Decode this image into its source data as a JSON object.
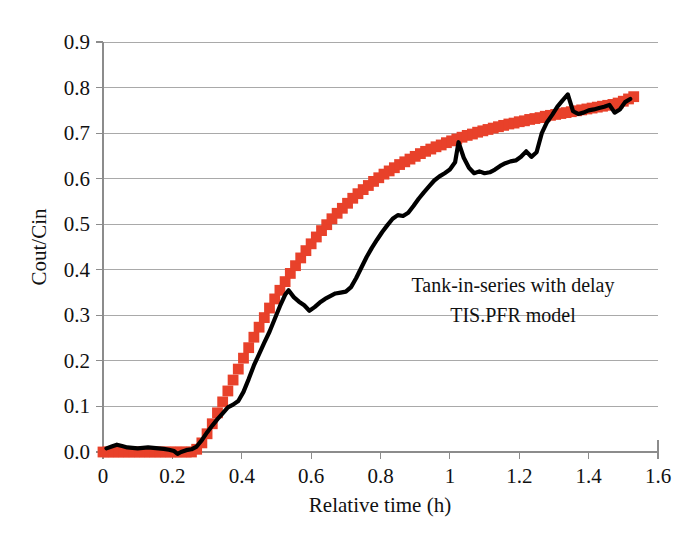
{
  "chart_data": {
    "type": "line",
    "title": "",
    "xlabel": "Relative time (h)",
    "ylabel": "Cout/Cin",
    "xlim": [
      0,
      1.6
    ],
    "ylim": [
      0.0,
      0.9
    ],
    "grid": true,
    "legend_position": "none",
    "x_ticks": [
      "0",
      "0.2",
      "0.4",
      "0.6",
      "0.8",
      "1",
      "1.2",
      "1.4",
      "1.6"
    ],
    "x_tick_values": [
      0,
      0.2,
      0.4,
      0.6,
      0.8,
      1.0,
      1.2,
      1.4,
      1.6
    ],
    "y_ticks": [
      "0.0",
      "0.1",
      "0.2",
      "0.3",
      "0.4",
      "0.5",
      "0.6",
      "0.7",
      "0.8",
      "0.9"
    ],
    "y_tick_values": [
      0.0,
      0.1,
      0.2,
      0.3,
      0.4,
      0.5,
      0.6,
      0.7,
      0.8,
      0.9
    ],
    "annotations": [
      "Tank-in-series with delay",
      "TIS.PFR model"
    ],
    "colors": {
      "measured_line": "#000000",
      "model_marker": "#e8412a",
      "gridline": "#a9a9a9",
      "axis": "#8c8c8c",
      "background": "#ffffff",
      "text": "#111111"
    },
    "series": [
      {
        "name": "Measured tracer response",
        "style": "line",
        "color": "#000000",
        "x": [
          0.01,
          0.025,
          0.04,
          0.055,
          0.07,
          0.085,
          0.1,
          0.115,
          0.13,
          0.145,
          0.16,
          0.175,
          0.19,
          0.205,
          0.215,
          0.225,
          0.24,
          0.255,
          0.27,
          0.285,
          0.3,
          0.315,
          0.33,
          0.345,
          0.36,
          0.375,
          0.39,
          0.405,
          0.42,
          0.435,
          0.45,
          0.465,
          0.48,
          0.495,
          0.51,
          0.525,
          0.535,
          0.55,
          0.565,
          0.58,
          0.595,
          0.61,
          0.625,
          0.64,
          0.655,
          0.67,
          0.685,
          0.7,
          0.715,
          0.73,
          0.745,
          0.76,
          0.775,
          0.79,
          0.805,
          0.82,
          0.835,
          0.85,
          0.865,
          0.88,
          0.895,
          0.91,
          0.925,
          0.94,
          0.955,
          0.97,
          0.985,
          1.0,
          1.015,
          1.025,
          1.04,
          1.055,
          1.07,
          1.085,
          1.1,
          1.115,
          1.13,
          1.145,
          1.16,
          1.175,
          1.19,
          1.205,
          1.22,
          1.235,
          1.25,
          1.265,
          1.28,
          1.295,
          1.31,
          1.325,
          1.34,
          1.355,
          1.37,
          1.385,
          1.4,
          1.415,
          1.43,
          1.445,
          1.46,
          1.475,
          1.49,
          1.505,
          1.52
        ],
        "y": [
          0.008,
          0.012,
          0.016,
          0.013,
          0.01,
          0.009,
          0.008,
          0.009,
          0.01,
          0.009,
          0.008,
          0.007,
          0.005,
          0.002,
          -0.004,
          0.0,
          0.004,
          0.006,
          0.012,
          0.026,
          0.043,
          0.058,
          0.072,
          0.085,
          0.098,
          0.104,
          0.112,
          0.132,
          0.16,
          0.19,
          0.215,
          0.24,
          0.264,
          0.292,
          0.32,
          0.345,
          0.355,
          0.34,
          0.33,
          0.322,
          0.31,
          0.318,
          0.328,
          0.336,
          0.342,
          0.348,
          0.35,
          0.352,
          0.362,
          0.382,
          0.405,
          0.428,
          0.448,
          0.466,
          0.483,
          0.498,
          0.512,
          0.52,
          0.518,
          0.525,
          0.54,
          0.556,
          0.57,
          0.583,
          0.596,
          0.605,
          0.612,
          0.62,
          0.636,
          0.68,
          0.646,
          0.624,
          0.612,
          0.616,
          0.612,
          0.614,
          0.62,
          0.628,
          0.634,
          0.638,
          0.64,
          0.648,
          0.66,
          0.648,
          0.658,
          0.7,
          0.724,
          0.74,
          0.758,
          0.772,
          0.785,
          0.748,
          0.742,
          0.745,
          0.75,
          0.752,
          0.755,
          0.758,
          0.762,
          0.745,
          0.752,
          0.768,
          0.775
        ]
      },
      {
        "name": "TIS.PFR model",
        "style": "markers",
        "marker": "square",
        "color": "#e8412a",
        "x": [
          0.0,
          0.015,
          0.03,
          0.045,
          0.06,
          0.075,
          0.09,
          0.105,
          0.12,
          0.135,
          0.15,
          0.165,
          0.18,
          0.195,
          0.21,
          0.225,
          0.24,
          0.255,
          0.27,
          0.285,
          0.3,
          0.315,
          0.33,
          0.345,
          0.36,
          0.375,
          0.39,
          0.405,
          0.42,
          0.435,
          0.45,
          0.465,
          0.48,
          0.495,
          0.51,
          0.525,
          0.54,
          0.555,
          0.57,
          0.585,
          0.6,
          0.615,
          0.63,
          0.645,
          0.66,
          0.675,
          0.69,
          0.705,
          0.72,
          0.735,
          0.75,
          0.765,
          0.78,
          0.795,
          0.81,
          0.825,
          0.84,
          0.855,
          0.87,
          0.885,
          0.9,
          0.915,
          0.93,
          0.945,
          0.96,
          0.975,
          0.99,
          1.005,
          1.02,
          1.035,
          1.05,
          1.065,
          1.08,
          1.095,
          1.11,
          1.125,
          1.14,
          1.155,
          1.17,
          1.185,
          1.2,
          1.215,
          1.23,
          1.245,
          1.26,
          1.275,
          1.29,
          1.305,
          1.32,
          1.335,
          1.35,
          1.365,
          1.38,
          1.395,
          1.41,
          1.425,
          1.44,
          1.455,
          1.47,
          1.485,
          1.5,
          1.515,
          1.53
        ],
        "y": [
          0.0,
          0.0,
          0.0,
          0.0,
          0.0,
          0.0,
          0.0,
          0.0,
          0.0,
          0.0,
          0.0,
          0.0,
          0.0,
          0.0,
          0.0,
          0.0,
          0.0,
          0.0,
          0.006,
          0.02,
          0.04,
          0.062,
          0.086,
          0.11,
          0.134,
          0.158,
          0.182,
          0.206,
          0.229,
          0.252,
          0.274,
          0.295,
          0.316,
          0.336,
          0.355,
          0.374,
          0.392,
          0.409,
          0.426,
          0.442,
          0.457,
          0.472,
          0.486,
          0.499,
          0.512,
          0.524,
          0.535,
          0.546,
          0.557,
          0.567,
          0.576,
          0.585,
          0.594,
          0.602,
          0.61,
          0.617,
          0.624,
          0.631,
          0.637,
          0.643,
          0.649,
          0.655,
          0.66,
          0.665,
          0.67,
          0.674,
          0.679,
          0.683,
          0.687,
          0.691,
          0.695,
          0.698,
          0.702,
          0.705,
          0.708,
          0.711,
          0.714,
          0.717,
          0.72,
          0.722,
          0.725,
          0.727,
          0.73,
          0.732,
          0.734,
          0.737,
          0.739,
          0.741,
          0.743,
          0.745,
          0.747,
          0.749,
          0.751,
          0.753,
          0.755,
          0.757,
          0.759,
          0.761,
          0.763,
          0.766,
          0.77,
          0.775,
          0.78
        ]
      }
    ]
  }
}
